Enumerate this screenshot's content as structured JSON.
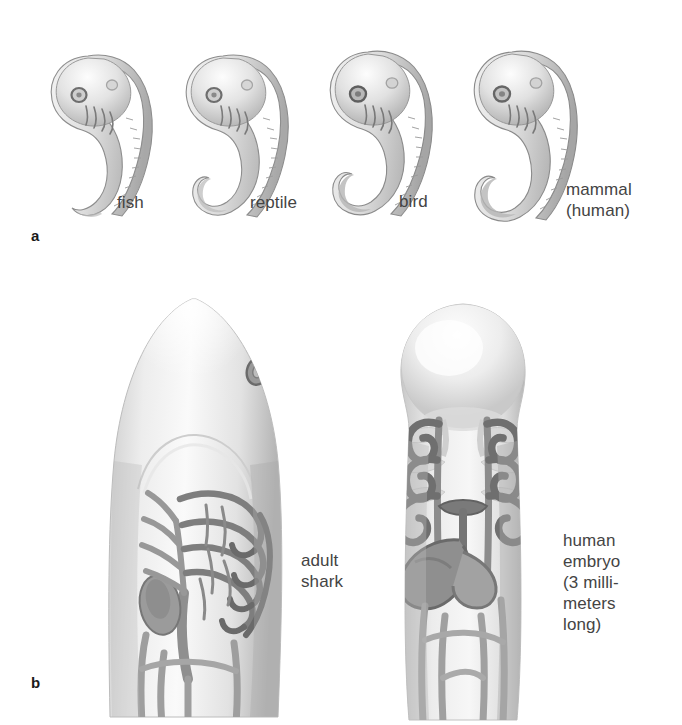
{
  "figure": {
    "background_color": "#ffffff",
    "ink_color": "#4a4a4a",
    "label_color": "#444444"
  },
  "panels": [
    {
      "id": "a",
      "letter": "a",
      "items": [
        {
          "id": "fish",
          "label": "fish"
        },
        {
          "id": "reptile",
          "label": "reptile"
        },
        {
          "id": "bird",
          "label": "bird"
        },
        {
          "id": "mammal",
          "label": "mammal\n(human)"
        }
      ]
    },
    {
      "id": "b",
      "letter": "b",
      "items": [
        {
          "id": "shark",
          "label": "adult\nshark"
        },
        {
          "id": "human-embryo",
          "label": "human\nembryo\n(3 milli-\nmeters\nlong)"
        }
      ]
    }
  ]
}
